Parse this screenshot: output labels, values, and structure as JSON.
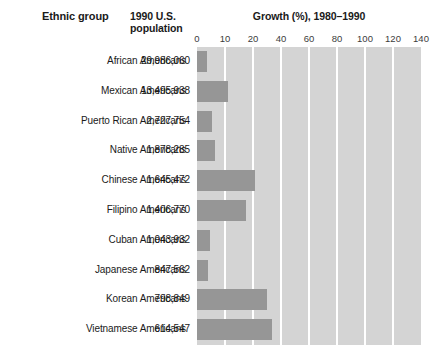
{
  "header": {
    "col_ethnic_group": "Ethnic group",
    "col_population": "1990 U.S.\npopulation",
    "col_population_line1": "1990 U.S.",
    "col_population_line2": "population",
    "chart_title": "Growth (%), 1980–1990"
  },
  "chart_data": {
    "type": "bar",
    "orientation": "horizontal",
    "title": "Growth (%), 1980–1990",
    "xlabel": "Growth (%)",
    "ylabel": "Ethnic group",
    "xlim": [
      0,
      140
    ],
    "xticks": [
      0,
      10,
      20,
      40,
      60,
      80,
      100,
      120,
      140
    ],
    "xtick_labels": [
      "0",
      "10",
      "20",
      "40",
      "60",
      "80",
      "100",
      "120",
      "140"
    ],
    "grid": true,
    "legend": false,
    "note_scale": "Axis is non-uniform: 0-10-20 then 20-unit steps, each interval one equal band",
    "categories": [
      "African Americans",
      "Mexican Americans",
      "Puerto Rican Americans",
      "Native Americans",
      "Chinese Americans",
      "Filipino Americans",
      "Cuban Americans",
      "Japanese Americans",
      "Korean Americans",
      "Vietnamese Americans"
    ],
    "values": [
      18,
      54,
      35,
      38,
      104,
      82,
      30,
      21,
      125,
      135
    ],
    "populations": [
      "29,986,060",
      "13,495,938",
      "2,727,754",
      "1,878,285",
      "1,645,472",
      "1,406,770",
      "1,043,932",
      "847,562",
      "798,849",
      "614,547"
    ],
    "bar_fractions": [
      0.185,
      0.555,
      0.27,
      0.325,
      1.04,
      0.88,
      0.24,
      0.19,
      1.25,
      1.345
    ]
  },
  "colors": {
    "bar_fill": "#969696",
    "plot_background": "#d4d4d4",
    "gridline": "#ffffff",
    "text": "#1a1a1a",
    "page_background": "#ffffff"
  }
}
